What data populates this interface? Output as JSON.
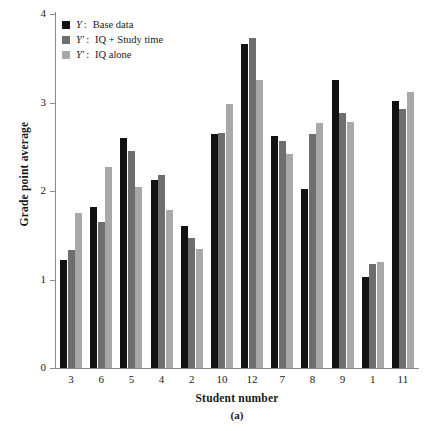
{
  "chart_data": {
    "type": "bar",
    "title": "",
    "xlabel": "Student number",
    "ylabel": "Grade point average",
    "caption": "(a)",
    "categories": [
      "3",
      "6",
      "5",
      "4",
      "2",
      "10",
      "12",
      "7",
      "8",
      "9",
      "1",
      "11"
    ],
    "ylim": [
      0,
      4
    ],
    "yticks": [
      0,
      1,
      2,
      3,
      4
    ],
    "grid": false,
    "legend_position": "top-left",
    "series": [
      {
        "name": "Y:  Base data",
        "symbol": "Y",
        "label": "Base data",
        "color": "#121212",
        "values": [
          1.22,
          1.82,
          2.6,
          2.13,
          1.6,
          2.64,
          3.66,
          2.62,
          2.02,
          3.25,
          1.03,
          3.02
        ]
      },
      {
        "name": "Y′:  IQ + Study time",
        "symbol": "Y′",
        "label": "IQ + Study time",
        "color": "#6e6e6e",
        "values": [
          1.33,
          1.65,
          2.45,
          2.18,
          1.47,
          2.66,
          3.73,
          2.56,
          2.64,
          2.88,
          1.17,
          2.93
        ]
      },
      {
        "name": "Y′:  IQ alone",
        "symbol": "Y′",
        "label": "IQ alone",
        "color": "#a8a8a8",
        "values": [
          1.75,
          2.27,
          2.05,
          1.78,
          1.35,
          2.98,
          3.26,
          2.42,
          2.77,
          2.78,
          1.2,
          3.12
        ]
      }
    ]
  },
  "axis": {
    "y_tick_labels": [
      "0",
      "1",
      "2",
      "3",
      "4"
    ],
    "x_tick_labels": [
      "3",
      "6",
      "5",
      "4",
      "2",
      "10",
      "12",
      "7",
      "8",
      "9",
      "1",
      "11"
    ]
  }
}
